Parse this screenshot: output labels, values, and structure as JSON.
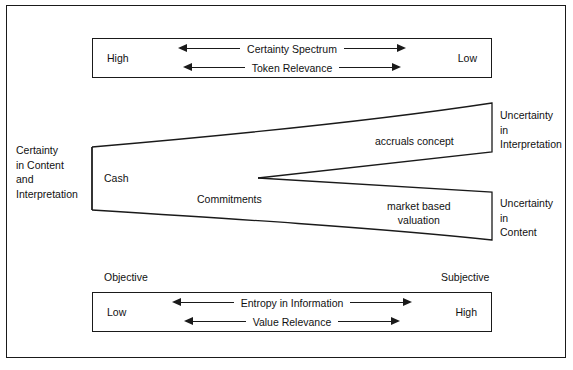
{
  "figure": {
    "top_spectrum": {
      "left_label": "High",
      "right_label": "Low",
      "rows": [
        {
          "caption": "Certainty Spectrum"
        },
        {
          "caption": "Token Relevance"
        }
      ]
    },
    "bottom_spectrum": {
      "above_left_label": "Objective",
      "above_right_label": "Subjective",
      "left_label": "Low",
      "right_label": "High",
      "rows": [
        {
          "caption": "Entropy in Information"
        },
        {
          "caption": "Value Relevance"
        }
      ]
    },
    "left_axis_label": "Certainty\nin Content\nand\nInterpretation",
    "right_labels": {
      "upper": "Uncertainty\nin\nInterpretation",
      "lower": "Uncertainty\nin\nContent"
    },
    "funnel_labels": {
      "origin": "Cash",
      "middle": "Commitments",
      "upper_branch": "accruals concept",
      "lower_branch": "market based\nvaluation"
    },
    "colors": {
      "stroke": "#1a1a1a",
      "text": "#111111",
      "background": "#ffffff"
    }
  }
}
